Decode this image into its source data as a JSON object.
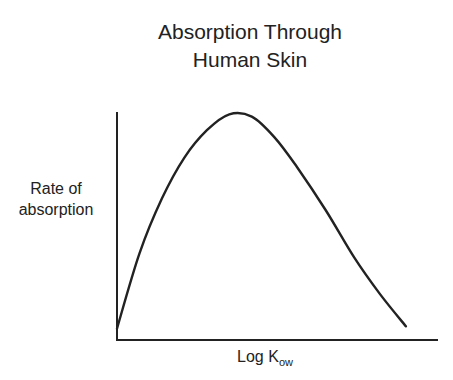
{
  "chart_data": {
    "type": "line",
    "title": "Absorption Through Human Skin",
    "title_lines": [
      "Absorption Through",
      "Human Skin"
    ],
    "xlabel": "Log K",
    "xlabel_subscript": "ow",
    "ylabel": "Rate of absorption",
    "ylabel_lines": [
      "Rate of",
      "absorption"
    ],
    "x_ticks": [],
    "y_ticks": [],
    "grid": false,
    "legend": null,
    "xlim": [
      0,
      1
    ],
    "ylim": [
      0,
      1
    ],
    "series": [
      {
        "name": "Rate of absorption",
        "color": "#222222",
        "x": [
          0.0,
          0.07,
          0.14,
          0.21,
          0.28,
          0.35,
          0.42,
          0.49,
          0.56,
          0.65,
          0.74,
          0.82,
          0.9
        ],
        "values": [
          0.05,
          0.38,
          0.62,
          0.8,
          0.92,
          0.99,
          0.98,
          0.89,
          0.76,
          0.57,
          0.36,
          0.2,
          0.06
        ]
      }
    ]
  }
}
